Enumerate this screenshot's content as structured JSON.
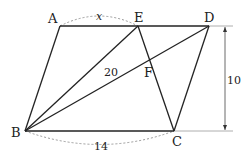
{
  "diagram": {
    "type": "geometry-parallelogram",
    "points": {
      "A": {
        "label": "A",
        "x": 60,
        "y": 26
      },
      "E": {
        "label": "E",
        "x": 138,
        "y": 26
      },
      "D": {
        "label": "D",
        "x": 209,
        "y": 26
      },
      "B": {
        "label": "B",
        "x": 25,
        "y": 131
      },
      "C": {
        "label": "C",
        "x": 174,
        "y": 131
      },
      "F": {
        "label": "F",
        "x": 150,
        "y": 62
      }
    },
    "segments": [
      [
        "A",
        "D"
      ],
      [
        "A",
        "B"
      ],
      [
        "B",
        "C"
      ],
      [
        "C",
        "D"
      ],
      [
        "B",
        "E"
      ],
      [
        "B",
        "D"
      ],
      [
        "E",
        "C"
      ]
    ],
    "labels": {
      "AE": "x",
      "BC": "14",
      "area": "20",
      "height": "10"
    }
  }
}
